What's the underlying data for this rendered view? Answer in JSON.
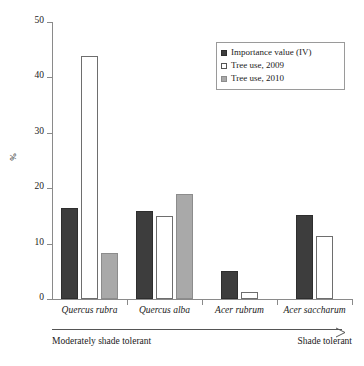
{
  "chart_data": {
    "type": "bar",
    "title": "",
    "xlabel": "",
    "ylabel": "%",
    "ylim": [
      0,
      50
    ],
    "yticks": [
      0,
      10,
      20,
      30,
      40,
      50
    ],
    "grid": false,
    "legend_position": "top-right",
    "categories": [
      "Quercus rubra",
      "Quercus alba",
      "Acer rubrum",
      "Acer saccharum"
    ],
    "series": [
      {
        "name": "Importance value (IV)",
        "color": "#3d3d3d",
        "values": [
          16.5,
          15.8,
          5.0,
          15.2
        ]
      },
      {
        "name": "Tree use, 2009",
        "color": "#ffffff",
        "values": [
          43.8,
          15.0,
          1.2,
          11.3
        ]
      },
      {
        "name": "Tree use, 2010",
        "color": "#a9a9a9",
        "values": [
          8.3,
          19.0,
          null,
          null
        ]
      }
    ],
    "annotations": {
      "axis_gradient_left": "Moderately shade tolerant",
      "axis_gradient_right": "Shade tolerant",
      "arrow_direction": "right"
    }
  },
  "legend": {
    "items": [
      {
        "label": "Importance value (IV)",
        "swatch": "iv"
      },
      {
        "label": "Tree use, 2009",
        "swatch": "use2009"
      },
      {
        "label": "Tree use, 2010",
        "swatch": "use2010"
      }
    ]
  },
  "axis": {
    "y_label": "%",
    "y_ticks": [
      "50",
      "40",
      "30",
      "20",
      "10",
      "0"
    ]
  },
  "x_labels": [
    "Quercus rubra",
    "Quercus alba",
    "Acer rubrum",
    "Acer saccharum"
  ],
  "tolerance": {
    "left": "Moderately shade tolerant",
    "right": "Shade tolerant"
  }
}
